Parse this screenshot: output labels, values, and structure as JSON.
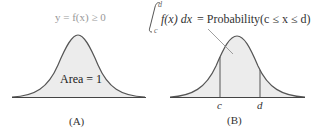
{
  "panel_a": {
    "caption": "(A)",
    "top_label": "y = f(x) ≥ 0",
    "area_label": "Area = 1"
  },
  "panel_b": {
    "caption": "(B)",
    "integral_upper": "d",
    "integral_lower": "c",
    "formula_integrand": "f(x) dx",
    "formula_rhs": "= Probability(c ≤ x ≤ d)",
    "tick_c": "c",
    "tick_d": "d"
  },
  "colors": {
    "curve": "#555555",
    "fill": "#ececec",
    "label_gray": "#999999",
    "text": "#222222"
  }
}
